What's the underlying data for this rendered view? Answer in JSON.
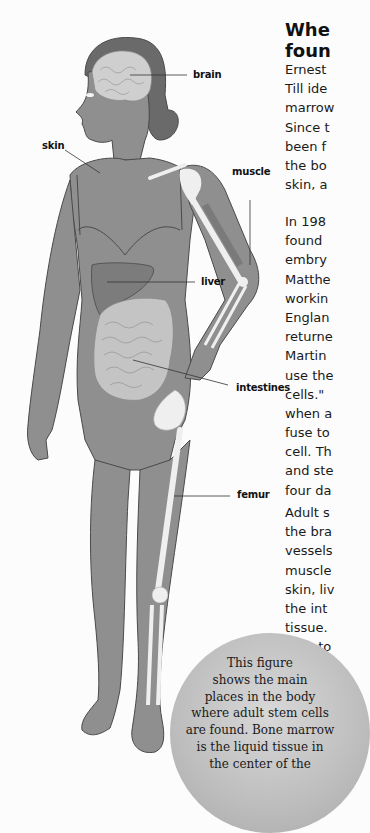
{
  "heading": {
    "lines": [
      "Whe",
      "foun"
    ]
  },
  "body": {
    "paragraph1": [
      "Ernest",
      "Till ide",
      "marrow",
      "Since t",
      "been f",
      "the bo",
      "skin, a"
    ],
    "paragraph2": [
      "In 198",
      "found",
      "embry",
      "Matthe",
      "workin",
      "Englan",
      "returne",
      "Martin",
      "use the",
      "cells.\"",
      "when a",
      "fuse to",
      "cell. Th",
      "and ste",
      "four da"
    ],
    "paragraph3": [
      "Adult s",
      "the bra",
      "vessels",
      "muscle",
      "skin, liv",
      "the int",
      "tissue.",
      "cells to",
      "dar"
    ]
  },
  "figure_labels": {
    "brain": "brain",
    "skin": "skin",
    "muscle": "muscle",
    "liver": "liver",
    "intestines": "intestines",
    "femur": "femur"
  },
  "caption": {
    "lines": [
      "This figure",
      "shows the main",
      "places in the body",
      "where adult stem cells",
      "are found. Bone marrow",
      "is the liquid tissue in",
      "the center of the"
    ]
  },
  "colors": {
    "body_fill": "#8f8f8f",
    "organ_fill": "#c9c9c9",
    "bone_fill": "#efefef",
    "hair_fill": "#6a6a6a",
    "outline": "#4a4a4a",
    "caption_circle": "#bdbdbd"
  }
}
